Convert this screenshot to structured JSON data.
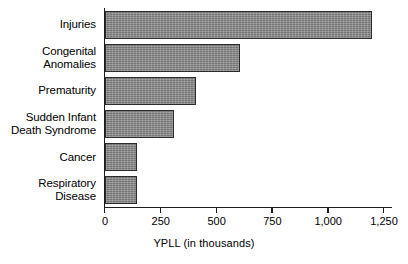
{
  "chart_data": {
    "type": "bar",
    "orientation": "horizontal",
    "title": "",
    "xlabel": "YPLL (in thousands)",
    "ylabel": "",
    "xlim": [
      0,
      1250
    ],
    "xticks": [
      0,
      250,
      500,
      750,
      1000,
      1250
    ],
    "xtick_labels": [
      "0",
      "250",
      "500",
      "750",
      "1,000",
      "1,250"
    ],
    "grid": false,
    "legend": null,
    "bar_color": "#8c8c8c",
    "bar_edge_color": "#2b2b2b",
    "categories": [
      "Injuries",
      "Congenital\nAnomalies",
      "Prematurity",
      "Sudden Infant\nDeath Syndrome",
      "Cancer",
      "Respiratory\nDisease"
    ],
    "values": [
      1190,
      600,
      405,
      305,
      140,
      140
    ]
  }
}
